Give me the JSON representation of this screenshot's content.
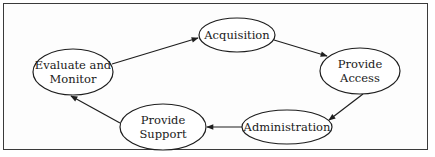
{
  "diagram": {
    "type": "cycle",
    "colors": {
      "stroke": "#1e1e1e",
      "background": "#ffffff",
      "text": "#1a1a1a"
    },
    "nodes": [
      {
        "id": "evaluate",
        "lines": [
          "Evaluate and",
          "Monitor"
        ],
        "cx": 73,
        "cy": 72,
        "rx": 40,
        "ry": 23
      },
      {
        "id": "acquisition",
        "lines": [
          "Acquisition"
        ],
        "cx": 237,
        "cy": 35,
        "rx": 38,
        "ry": 17
      },
      {
        "id": "access",
        "lines": [
          "Provide",
          "Access"
        ],
        "cx": 360,
        "cy": 71,
        "rx": 40,
        "ry": 23
      },
      {
        "id": "administration",
        "lines": [
          "Administration"
        ],
        "cx": 287,
        "cy": 127,
        "rx": 45,
        "ry": 17
      },
      {
        "id": "support",
        "lines": [
          "Provide",
          "Support"
        ],
        "cx": 163,
        "cy": 127,
        "rx": 43,
        "ry": 23
      }
    ],
    "edges": [
      {
        "from": "evaluate",
        "to": "acquisition"
      },
      {
        "from": "acquisition",
        "to": "access"
      },
      {
        "from": "access",
        "to": "administration"
      },
      {
        "from": "administration",
        "to": "support"
      },
      {
        "from": "support",
        "to": "evaluate"
      }
    ]
  }
}
